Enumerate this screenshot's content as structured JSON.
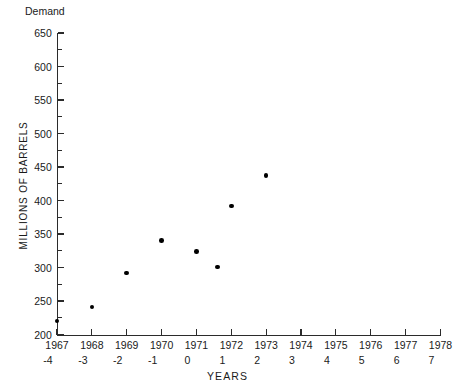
{
  "chart_data": {
    "type": "scatter",
    "title": "",
    "xlabel": "YEARS",
    "ylabel": "MILLIONS OF BARRELS",
    "corner_label": "Demand",
    "xlim": [
      -4,
      7
    ],
    "ylim": [
      200,
      650
    ],
    "grid": false,
    "legend": null,
    "y_ticks": [
      200,
      250,
      300,
      350,
      400,
      450,
      500,
      550,
      600,
      650
    ],
    "y_minor_step": 25,
    "x_ticks_codes": [
      -4,
      -3,
      -2,
      -1,
      0,
      1,
      2,
      3,
      4,
      5,
      6,
      7
    ],
    "x_ticks_years": [
      1967,
      1968,
      1969,
      1970,
      1971,
      1972,
      1973,
      1974,
      1975,
      1976,
      1977,
      1978
    ],
    "points": [
      {
        "code": -4,
        "year": 1967,
        "demand": 220
      },
      {
        "code": -3,
        "year": 1968,
        "demand": 241
      },
      {
        "code": -2,
        "year": 1969,
        "demand": 292
      },
      {
        "code": -1,
        "year": 1970,
        "demand": 340
      },
      {
        "code": 0,
        "year": 1971,
        "demand": 324
      },
      {
        "code": 0.6,
        "year": 1971.6,
        "demand": 301
      },
      {
        "code": 1,
        "year": 1972,
        "demand": 392
      },
      {
        "code": 2,
        "year": 1973,
        "demand": 437
      }
    ]
  },
  "marker": {
    "color": "#000000",
    "shape": "circle"
  },
  "axis": {
    "color": "#2b2b2b"
  }
}
